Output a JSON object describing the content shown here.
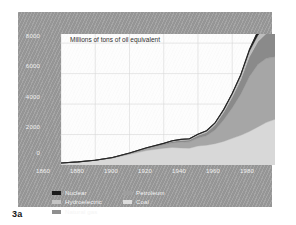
{
  "caption": "3a",
  "chart_data": {
    "type": "area",
    "title": "Millions of tons of oil equivalent",
    "xlabel": "",
    "ylabel": "Millions of tons of oil equivalent",
    "xlim": [
      1860,
      1985
    ],
    "ylim": [
      0,
      8600
    ],
    "xticks": [
      "1860",
      "1880",
      "1900",
      "1920",
      "1940",
      "1960",
      "1980"
    ],
    "xtick_values": [
      1860,
      1880,
      1900,
      1920,
      1940,
      1960,
      1980
    ],
    "yticks": [
      "0",
      "2000",
      "4000",
      "6000",
      "8000"
    ],
    "ytick_values": [
      0,
      2000,
      4000,
      6000,
      8000
    ],
    "grid": true,
    "stacked": true,
    "legend_position": "below-plot",
    "x": [
      1860,
      1870,
      1880,
      1890,
      1900,
      1910,
      1920,
      1925,
      1930,
      1935,
      1940,
      1945,
      1950,
      1955,
      1960,
      1965,
      1970,
      1975,
      1980,
      1985
    ],
    "series": [
      {
        "name": "Coal",
        "color": "#d8d8d8",
        "values": [
          130,
          200,
          300,
          450,
          700,
          950,
          1100,
          1150,
          1120,
          1100,
          1250,
          1300,
          1400,
          1550,
          1750,
          1950,
          2200,
          2500,
          2800,
          3000
        ]
      },
      {
        "name": "Petroleum",
        "color": "#a6a6a6",
        "values": [
          0,
          5,
          15,
          30,
          60,
          130,
          220,
          300,
          380,
          420,
          520,
          620,
          900,
          1400,
          2000,
          2700,
          3600,
          4100,
          4200,
          4100
        ]
      },
      {
        "name": "Natural gas",
        "color": "#8a8a8a",
        "values": [
          0,
          0,
          0,
          5,
          15,
          30,
          60,
          90,
          110,
          120,
          160,
          220,
          330,
          500,
          700,
          950,
          1300,
          1500,
          1650,
          1750
        ]
      },
      {
        "name": "Hydroelectric",
        "color": "#bdbdbd",
        "values": [
          0,
          0,
          0,
          2,
          8,
          20,
          40,
          55,
          70,
          80,
          95,
          110,
          140,
          180,
          230,
          290,
          360,
          420,
          470,
          500
        ]
      },
      {
        "name": "Nuclear",
        "color": "#1c1c1c",
        "values": [
          0,
          0,
          0,
          0,
          0,
          0,
          0,
          0,
          0,
          0,
          0,
          0,
          0,
          5,
          15,
          40,
          100,
          260,
          500,
          700
        ]
      }
    ],
    "legend": [
      {
        "label": "Nuclear",
        "color": "#1c1c1c"
      },
      {
        "label": "Hydroelectric",
        "color": "#c4c4c4"
      },
      {
        "label": "Natural gas",
        "color": "#8f8f8f"
      },
      {
        "label": "Petroleum",
        "color": "#9e9e9e"
      },
      {
        "label": "Coal",
        "color": "#dcdcdc"
      }
    ]
  }
}
